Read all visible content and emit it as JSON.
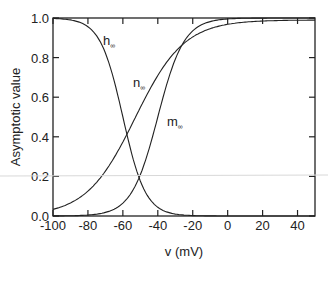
{
  "chart_data": {
    "type": "line",
    "title": "",
    "xlabel": "v (mV)",
    "ylabel": "Asymptotic value",
    "xlim": [
      -100,
      50
    ],
    "ylim": [
      0.0,
      1.0
    ],
    "grid": false,
    "legend": "inline curve labels",
    "x_ticks": [
      "-100",
      "-80",
      "-60",
      "-40",
      "-20",
      "0",
      "20",
      "40"
    ],
    "y_ticks": [
      "0.0",
      "0.2",
      "0.4",
      "0.6",
      "0.8",
      "1.0"
    ],
    "x": [
      -100,
      -90,
      -80,
      -70,
      -60,
      -55,
      -50,
      -40,
      -30,
      -20,
      -10,
      0,
      10,
      20,
      30,
      40,
      50
    ],
    "series": [
      {
        "name": "h∞",
        "label": "h",
        "subscript": "∞",
        "values": [
          0.998,
          0.99,
          0.95,
          0.8,
          0.4,
          0.22,
          0.1,
          0.03,
          0.01,
          0.003,
          0.001,
          0.0,
          0.0,
          0.0,
          0.0,
          0.0,
          0.0
        ]
      },
      {
        "name": "n∞",
        "label": "n",
        "subscript": "∞",
        "values": [
          0.03,
          0.06,
          0.12,
          0.23,
          0.38,
          0.47,
          0.55,
          0.68,
          0.78,
          0.84,
          0.88,
          0.91,
          0.93,
          0.95,
          0.96,
          0.97,
          0.98
        ]
      },
      {
        "name": "m∞",
        "label": "m",
        "subscript": "∞",
        "values": [
          0.0,
          0.0,
          0.01,
          0.04,
          0.11,
          0.18,
          0.28,
          0.53,
          0.79,
          0.93,
          0.97,
          0.99,
          1.0,
          1.0,
          1.0,
          1.0,
          1.0
        ]
      }
    ]
  },
  "labels": {
    "h": "h",
    "n": "n",
    "m": "m",
    "sub": "∞",
    "xlabel": "v (mV)",
    "ylabel": "Asymptotic value"
  }
}
